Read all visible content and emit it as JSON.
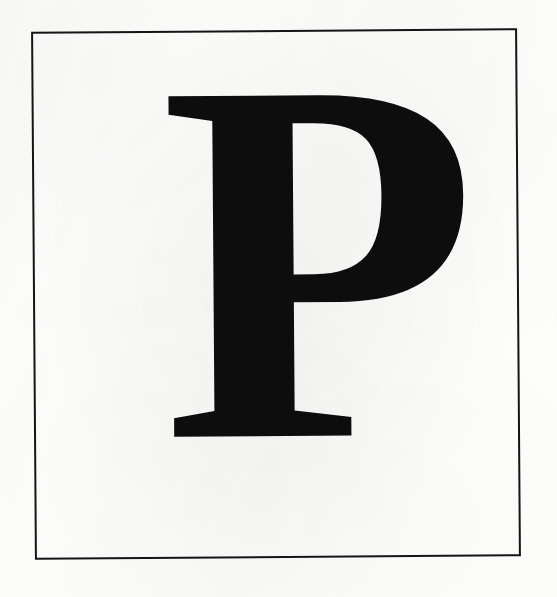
{
  "page": {
    "kind": "scanned-plate",
    "background_color": "#fdfdfc",
    "width": 557,
    "height": 597
  },
  "frame": {
    "name": "plate-border",
    "stroke_color": "#151515",
    "stroke_width": "2px",
    "left": 33,
    "top": 30,
    "width": 486,
    "height": 528,
    "rotation_deg": -0.42
  },
  "glyph": {
    "character": "P",
    "label": "capital-letter-p",
    "style": "serif-bold",
    "color": "#0d0d0d",
    "font_size": 520,
    "baseline_x": 128,
    "baseline_y": 406
  }
}
